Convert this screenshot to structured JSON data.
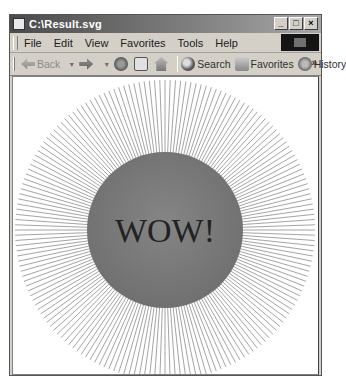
{
  "window": {
    "title": "C:\\Result.svg",
    "controls": {
      "minimize": "_",
      "maximize": "□",
      "close": "×"
    }
  },
  "menubar": {
    "items": [
      {
        "label": "File"
      },
      {
        "label": "Edit"
      },
      {
        "label": "View"
      },
      {
        "label": "Favorites"
      },
      {
        "label": "Tools"
      },
      {
        "label": "Help"
      }
    ]
  },
  "toolbar": {
    "back_label": "Back",
    "search_label": "Search",
    "favorites_label": "Favorites",
    "history_label": "History",
    "overflow": "»"
  },
  "content": {
    "text": "WOW!",
    "ray_count": 180,
    "ray_color": "#9a9a9a",
    "circle_color": "#7a7a7a",
    "text_color": "#222222"
  }
}
